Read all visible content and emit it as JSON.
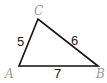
{
  "diagram": {
    "type": "triangle",
    "vertices": [
      {
        "name": "A",
        "label": "A",
        "x": 19,
        "y": 66
      },
      {
        "name": "B",
        "label": "B",
        "x": 98,
        "y": 66
      },
      {
        "name": "C",
        "label": "C",
        "x": 38,
        "y": 19
      }
    ],
    "sides": [
      {
        "between": "AC",
        "label": "5"
      },
      {
        "between": "CB",
        "label": "6"
      },
      {
        "between": "AB",
        "label": "7"
      }
    ],
    "colors": {
      "edge": "#111111",
      "vertex_label": "#9a9a9a",
      "side_label": "#1a1a1a"
    }
  }
}
